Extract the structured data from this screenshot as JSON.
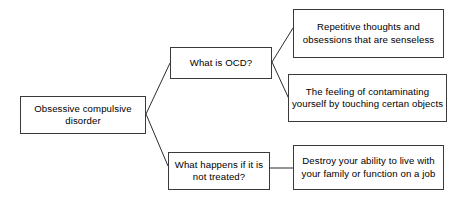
{
  "diagram": {
    "type": "concept-map",
    "background_color": "#ffffff",
    "box_border_color": "#3a3a3a",
    "connector_color": "#2b2b2b",
    "text_color": "#000000",
    "nodes": {
      "root": {
        "id": "root",
        "label": "Obsessive compulsive disorder",
        "role": "topic"
      },
      "question_1": {
        "id": "question_1",
        "label": "What is OCD?",
        "role": "question"
      },
      "question_2": {
        "id": "question_2",
        "label": "What happens if it is not treated?",
        "role": "question"
      },
      "answer_1": {
        "id": "answer_1",
        "label": "Repetitive thoughts and obsessions that are senseless",
        "role": "answer"
      },
      "answer_2": {
        "id": "answer_2",
        "label": "The feeling of contaminating yourself by touching certan objects",
        "role": "answer"
      },
      "answer_3": {
        "id": "answer_3",
        "label": "Destroy your ability to live with your family or function on a job",
        "role": "answer"
      }
    },
    "edges": [
      {
        "from": "root",
        "to": "question_1",
        "style": "diagonal"
      },
      {
        "from": "root",
        "to": "question_2",
        "style": "diagonal"
      },
      {
        "from": "question_1",
        "to": "answer_1",
        "style": "diagonal"
      },
      {
        "from": "question_1",
        "to": "answer_2",
        "style": "diagonal"
      },
      {
        "from": "question_2",
        "to": "answer_3",
        "style": "horizontal"
      }
    ]
  }
}
